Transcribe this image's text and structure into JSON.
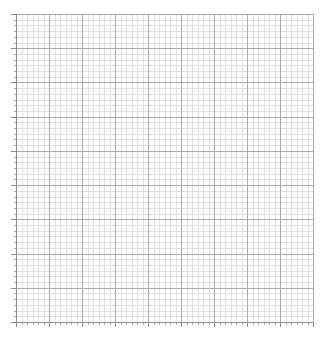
{
  "figure": {
    "width": 328,
    "height": 347,
    "background_color": "#ffffff",
    "title": "",
    "has_title": false,
    "has_legend": false,
    "has_data_series": false
  },
  "chart_data": {
    "type": "line",
    "title": "",
    "subtitle": "",
    "xlabel": "",
    "ylabel": "",
    "series": [],
    "x": [],
    "categories": [],
    "values": [],
    "annotations": [],
    "legend": {
      "visible": false,
      "position": "none",
      "entries": []
    },
    "grid": {
      "visible": true,
      "major_visible": true,
      "minor_visible": true,
      "major_color": "#ababab",
      "minor_color": "#dadada",
      "major_divisions_x": 9,
      "major_divisions_y": 9,
      "minor_per_major_x": 6,
      "minor_per_major_y": 6
    },
    "xaxis": {
      "xlim": [
        0,
        9
      ],
      "major_tick_values": [
        0,
        1,
        2,
        3,
        4,
        5,
        6,
        7,
        8,
        9
      ],
      "major_tick_labels": [
        "",
        "",
        "",
        "",
        "",
        "",
        "",
        "",
        "",
        ""
      ],
      "minor_ticks_visible": true,
      "spine_visible": true,
      "spine_color": "#8e8e8e"
    },
    "yaxis": {
      "ylim": [
        0,
        9
      ],
      "major_tick_values": [
        0,
        1,
        2,
        3,
        4,
        5,
        6,
        7,
        8,
        9
      ],
      "major_tick_labels": [
        "",
        "",
        "",
        "",
        "",
        "",
        "",
        "",
        "",
        ""
      ],
      "minor_ticks_visible": true,
      "spine_visible": true,
      "spine_color": "#8e8e8e"
    }
  },
  "plot_area": {
    "left": 16,
    "top": 14,
    "right": 313,
    "bottom": 322,
    "background_color": "#ffffff"
  }
}
